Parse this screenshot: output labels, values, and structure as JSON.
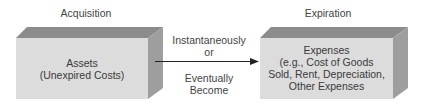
{
  "stages": {
    "left_heading": "Acquisition",
    "right_heading": "Expiration"
  },
  "left_box": {
    "title": "Assets",
    "subtitle": "(Unexpired Costs)"
  },
  "right_box": {
    "line1": "Expenses",
    "line2": "(e.g., Cost of Goods",
    "line3": "Sold, Rent, Depreciation,",
    "line4": "Other Expenses"
  },
  "arrow": {
    "above_line1": "Instantaneously",
    "above_line2": "or",
    "below_line1": "Eventually",
    "below_line2": "Become"
  },
  "colors": {
    "front_face": "#dcdcdc",
    "top_face": "#8c8c8c",
    "side_face": "#9e9e9e",
    "arrow": "#222222"
  }
}
